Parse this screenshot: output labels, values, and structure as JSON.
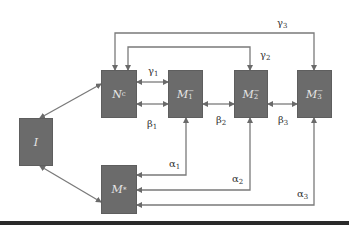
{
  "diagram": {
    "colors": {
      "box_fill": "#6b6b6b",
      "box_text": "#e6e6e6",
      "arrow": "#777777",
      "label": "#333333",
      "bottom_bar": "#2a2a2a"
    },
    "nodes": [
      {
        "id": "I",
        "label_main": "I",
        "label_sub": "",
        "label_sup": ""
      },
      {
        "id": "Nc",
        "label_main": "N",
        "label_sub": "c",
        "label_sup": ""
      },
      {
        "id": "M1",
        "label_main": "M",
        "label_sub": "1",
        "label_sup": "−"
      },
      {
        "id": "M2",
        "label_main": "M",
        "label_sub": "2",
        "label_sup": "−"
      },
      {
        "id": "M3",
        "label_main": "M",
        "label_sub": "3",
        "label_sup": "−"
      },
      {
        "id": "Mstar",
        "label_main": "M",
        "label_sub": "",
        "label_sup": "*"
      }
    ],
    "edge_labels": {
      "gamma1": {
        "sym": "γ",
        "sub": "1"
      },
      "gamma2": {
        "sym": "γ",
        "sub": "2"
      },
      "gamma3": {
        "sym": "γ",
        "sub": "3"
      },
      "beta1": {
        "sym": "β",
        "sub": "1"
      },
      "beta2": {
        "sym": "β",
        "sub": "2"
      },
      "beta3": {
        "sym": "β",
        "sub": "3"
      },
      "alpha1": {
        "sym": "α",
        "sub": "1"
      },
      "alpha2": {
        "sym": "α",
        "sub": "2"
      },
      "alpha3": {
        "sym": "α",
        "sub": "3"
      }
    },
    "edges": [
      {
        "from": "I",
        "to": "Nc",
        "type": "bidirectional"
      },
      {
        "from": "I",
        "to": "Mstar",
        "type": "bidirectional"
      },
      {
        "from": "Nc",
        "to": "M1",
        "label": "gamma1",
        "type": "bidirectional"
      },
      {
        "from": "Nc",
        "to": "M1",
        "label": "beta1",
        "type": "bidirectional"
      },
      {
        "from": "M1",
        "to": "M2",
        "label": "beta2",
        "type": "bidirectional"
      },
      {
        "from": "M2",
        "to": "M3",
        "label": "beta3",
        "type": "bidirectional"
      },
      {
        "from": "Nc",
        "to": "M2",
        "label": "gamma2",
        "type": "bidirectional"
      },
      {
        "from": "Nc",
        "to": "M3",
        "label": "gamma3",
        "type": "bidirectional"
      },
      {
        "from": "Mstar",
        "to": "M1",
        "label": "alpha1",
        "type": "bidirectional"
      },
      {
        "from": "Mstar",
        "to": "M2",
        "label": "alpha2",
        "type": "bidirectional"
      },
      {
        "from": "Mstar",
        "to": "M3",
        "label": "alpha3",
        "type": "bidirectional"
      }
    ]
  }
}
